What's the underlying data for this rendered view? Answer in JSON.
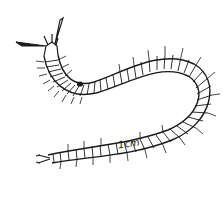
{
  "figure": {
    "scale_label": "1cm",
    "ink_color": "#1a1a1a",
    "background": "#ffffff"
  }
}
